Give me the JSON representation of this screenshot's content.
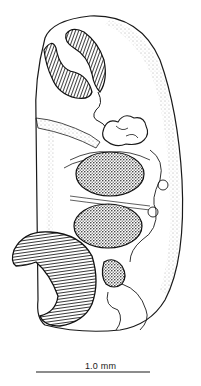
{
  "figure": {
    "type": "scientific line illustration",
    "colors": {
      "ink": "#1a1a1a",
      "background": "#ffffff",
      "stipple": "#555555"
    }
  },
  "scale_bar": {
    "label": "1.0 mm",
    "x_start": 36,
    "x_end": 150,
    "y": 372
  }
}
